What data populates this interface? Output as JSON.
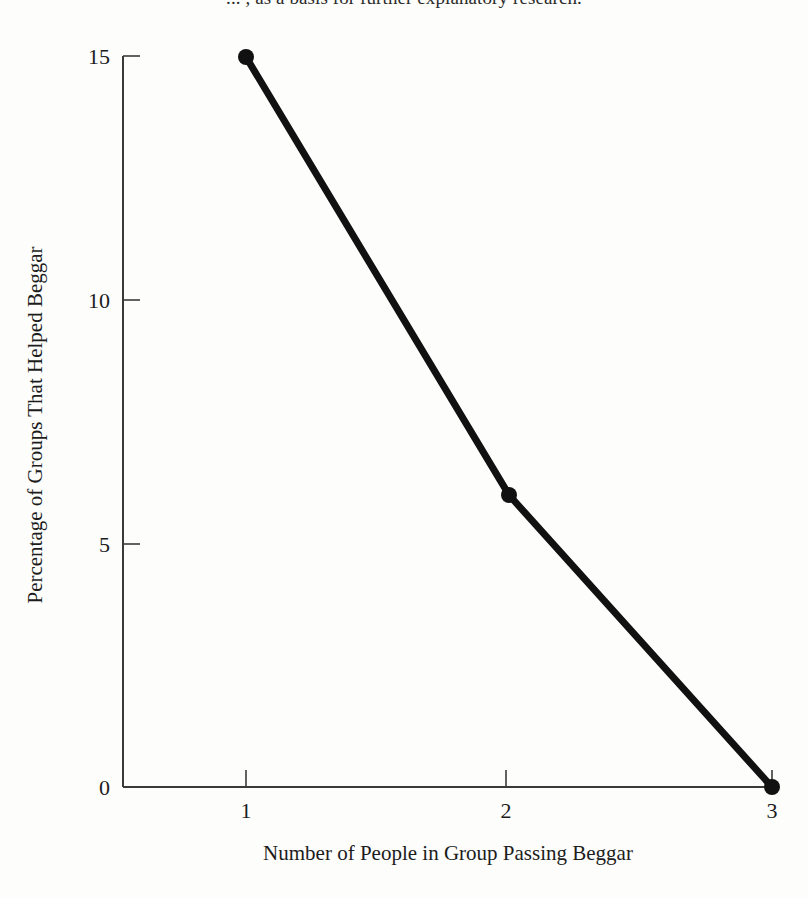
{
  "caption": {
    "text": "... , as a basis for further explanatory research."
  },
  "chart_data": {
    "type": "line",
    "title": "",
    "xlabel": "Number of People in Group Passing Beggar",
    "ylabel": "Percentage of Groups That Helped Beggar",
    "x": [
      1,
      2,
      3
    ],
    "values": [
      15,
      6,
      0
    ],
    "series": [
      {
        "name": "Percentage of Groups That Helped Beggar",
        "values": [
          15,
          6,
          0
        ]
      }
    ],
    "xtick_labels": [
      "1",
      "2",
      "3"
    ],
    "ytick_labels": [
      "0",
      "5",
      "10",
      "15"
    ],
    "xlim": [
      1,
      3
    ],
    "ylim": [
      0,
      15
    ],
    "grid": false,
    "legend": "none",
    "markers": "filled-circle",
    "line_color": "#111111",
    "axis_color": "#3a3a3a",
    "background_color": "#fdfdfb"
  },
  "axes": {
    "x_title": "Number of People in Group Passing Beggar",
    "y_title": "Percentage of Groups That Helped Beggar",
    "x_ticks": [
      {
        "label": "1",
        "value": 1
      },
      {
        "label": "2",
        "value": 2
      },
      {
        "label": "3",
        "value": 3
      }
    ],
    "y_ticks": [
      {
        "label": "15",
        "value": 15
      },
      {
        "label": "10",
        "value": 10
      },
      {
        "label": "5",
        "value": 5
      },
      {
        "label": "0",
        "value": 0
      }
    ]
  }
}
